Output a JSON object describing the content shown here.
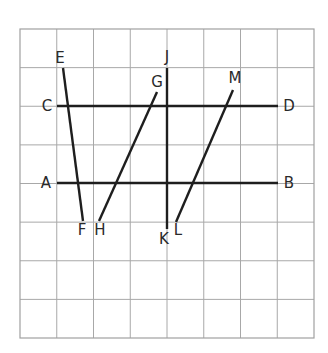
{
  "diagram": {
    "colors": {
      "background": "#ffffff",
      "grid": "#a8a8a8",
      "segment": "#1e1e1e",
      "label": "#2a2a2a"
    },
    "grid": {
      "columns": 8,
      "rows": 8,
      "left": 20,
      "top": 29,
      "right": 314,
      "bottom": 338
    },
    "segments": [
      {
        "id": "AB",
        "from": "A",
        "to": "B",
        "x1": 57,
        "y1": 183,
        "x2": 278,
        "y2": 183
      },
      {
        "id": "CD",
        "from": "C",
        "to": "D",
        "x1": 57,
        "y1": 106,
        "x2": 278,
        "y2": 106
      },
      {
        "id": "EF",
        "from": "E",
        "to": "F",
        "x1": 63,
        "y1": 68,
        "x2": 83,
        "y2": 221
      },
      {
        "id": "GH",
        "from": "G",
        "to": "H",
        "x1": 157,
        "y1": 92,
        "x2": 99,
        "y2": 221
      },
      {
        "id": "JK",
        "from": "J",
        "to": "K",
        "x1": 167,
        "y1": 68,
        "x2": 167,
        "y2": 229
      },
      {
        "id": "ML",
        "from": "M",
        "to": "L",
        "x1": 233,
        "y1": 90,
        "x2": 176,
        "y2": 222
      }
    ],
    "labels": [
      {
        "text": "A",
        "x": 46,
        "y": 183
      },
      {
        "text": "B",
        "x": 289,
        "y": 183
      },
      {
        "text": "C",
        "x": 47,
        "y": 106
      },
      {
        "text": "D",
        "x": 289,
        "y": 106
      },
      {
        "text": "E",
        "x": 60,
        "y": 58
      },
      {
        "text": "F",
        "x": 82,
        "y": 230
      },
      {
        "text": "G",
        "x": 157,
        "y": 82
      },
      {
        "text": "H",
        "x": 100,
        "y": 230
      },
      {
        "text": "J",
        "x": 167,
        "y": 57
      },
      {
        "text": "K",
        "x": 164,
        "y": 239
      },
      {
        "text": "L",
        "x": 178,
        "y": 230
      },
      {
        "text": "M",
        "x": 235,
        "y": 78
      }
    ]
  }
}
